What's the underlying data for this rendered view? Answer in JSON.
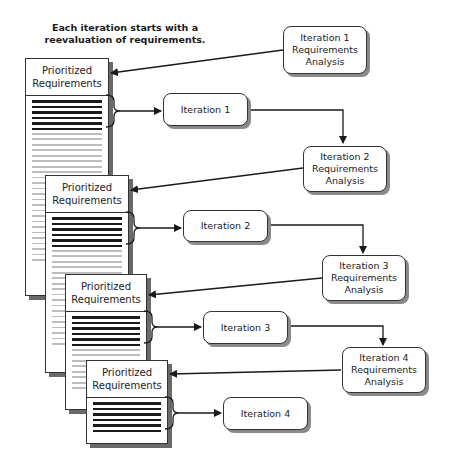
{
  "caption": {
    "line1": "Each iteration starts with a",
    "line2": "reevaluation of requirements."
  },
  "documents": [
    {
      "header_line1": "Prioritized",
      "header_line2": "Requirements"
    },
    {
      "header_line1": "Prioritized",
      "header_line2": "Requirements"
    },
    {
      "header_line1": "Prioritized",
      "header_line2": "Requirements"
    },
    {
      "header_line1": "Prioritized",
      "header_line2": "Requirements"
    }
  ],
  "analysis_boxes": [
    {
      "line1": "Iteration 1",
      "line2": "Requirements",
      "line3": "Analysis"
    },
    {
      "line1": "Iteration 2",
      "line2": "Requirements",
      "line3": "Analysis"
    },
    {
      "line1": "Iteration 3",
      "line2": "Requirements",
      "line3": "Analysis"
    },
    {
      "line1": "Iteration 4",
      "line2": "Requirements",
      "line3": "Analysis"
    }
  ],
  "iteration_boxes": [
    {
      "label": "Iteration 1"
    },
    {
      "label": "Iteration 2"
    },
    {
      "label": "Iteration 3"
    },
    {
      "label": "Iteration 4"
    }
  ]
}
